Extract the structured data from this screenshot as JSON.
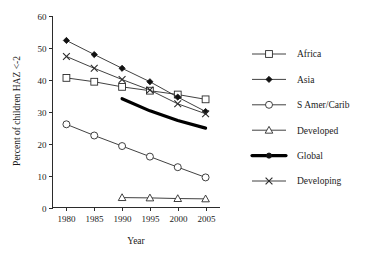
{
  "chart_data": {
    "type": "line",
    "title": "",
    "xlabel": "Year",
    "ylabel": "Percent of children HAZ <-2",
    "x": [
      1980,
      1985,
      1990,
      1995,
      2000,
      2005
    ],
    "xticklabels": [
      "1980",
      "1985",
      "1990",
      "1995",
      "2000",
      "2005"
    ],
    "yticks": [
      0,
      10,
      20,
      30,
      40,
      50,
      60
    ],
    "yticklabels": [
      "0",
      "10",
      "20",
      "30",
      "40",
      "50",
      "60"
    ],
    "xlim": [
      1977.5,
      2007.5
    ],
    "ylim": [
      0,
      60
    ],
    "grid": false,
    "legend_position": "right",
    "series": [
      {
        "name": "Africa",
        "marker": "open-square",
        "line": "thin",
        "x": [
          1980,
          1985,
          1990,
          1995,
          2000,
          2005
        ],
        "values": [
          40.5,
          39.3,
          37.7,
          36.5,
          35.3,
          33.8
        ]
      },
      {
        "name": "Asia",
        "marker": "filled-diamond",
        "line": "thin",
        "x": [
          1980,
          1985,
          1990,
          1995,
          2000,
          2005
        ],
        "values": [
          52.2,
          47.8,
          43.5,
          39.3,
          34.5,
          30.0
        ]
      },
      {
        "name": "S Amer/Carib",
        "marker": "open-circle",
        "line": "thin",
        "x": [
          1980,
          1985,
          1990,
          1995,
          2000,
          2005
        ],
        "values": [
          26.0,
          22.5,
          19.2,
          15.9,
          12.6,
          9.4
        ]
      },
      {
        "name": "Developed",
        "marker": "open-triangle",
        "line": "thin",
        "x": [
          1990,
          1995,
          2000,
          2005
        ],
        "values": [
          3.1,
          3.0,
          2.8,
          2.7
        ]
      },
      {
        "name": "Global",
        "marker": "filled-circle",
        "line": "thick",
        "x": [
          1990,
          1995,
          2000,
          2005
        ],
        "values": [
          34.0,
          30.2,
          27.2,
          24.8
        ]
      },
      {
        "name": "Developing",
        "marker": "cross",
        "line": "thin",
        "x": [
          1980,
          1985,
          1990,
          1995,
          2000,
          2005
        ],
        "values": [
          47.2,
          43.5,
          40.0,
          36.7,
          32.4,
          29.3
        ]
      }
    ]
  },
  "legend": {
    "items": [
      {
        "label": "Africa"
      },
      {
        "label": "Asia"
      },
      {
        "label": "S Amer/Carib"
      },
      {
        "label": "Developed"
      },
      {
        "label": "Global"
      },
      {
        "label": "Developing"
      }
    ]
  }
}
